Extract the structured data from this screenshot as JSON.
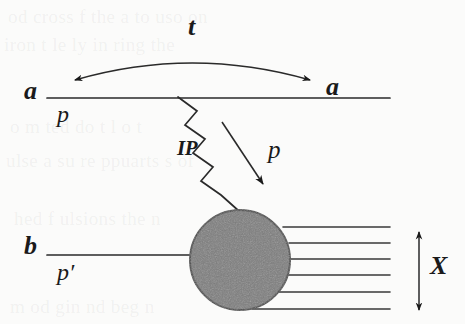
{
  "figure": {
    "kind": "feynman-diagram",
    "width": 465,
    "height": 324,
    "background_color": "#fbfbfa",
    "ink_color": "#1a1a1a",
    "blob_fill_color": "#7d7d7d",
    "blob_stroke_color": "#4a4a4a"
  },
  "labels": {
    "a_left": "a",
    "a_right": "a",
    "p_top": "p",
    "t": "t",
    "pomeron": "IP",
    "p_out": "p",
    "b_left": "b",
    "p_prime": "p′",
    "X": "X"
  },
  "elements": {
    "top_line": {
      "name": "beam-line-a",
      "x1": 47,
      "y1": 98,
      "x2": 390,
      "y2": 98
    },
    "bottom_line": {
      "name": "beam-line-b",
      "x1": 47,
      "y1": 255,
      "x2": 200,
      "y2": 255
    },
    "momentum_transfer_arc": {
      "name": "t-arc",
      "start_x": 75,
      "start_y": 80,
      "ctrl_x": 192,
      "ctrl_y": 48,
      "end_x": 310,
      "end_y": 80,
      "double_headed": true
    },
    "pomeron_zigzag": {
      "name": "pomeron-exchange",
      "points": "178,97 196,110 186,124 204,138 193,152 211,166 200,180 218,194 239,211"
    },
    "outgoing_proton_arrow": {
      "name": "outgoing-proton-arrow",
      "x1": 222,
      "y1": 122,
      "x2": 264,
      "y2": 186
    },
    "blob": {
      "name": "dissociation-blob",
      "cx": 240,
      "cy": 260,
      "r": 50
    },
    "x_system_lines": {
      "name": "x-system-lines",
      "count": 6,
      "lines": [
        {
          "x1": 283,
          "y1": 227,
          "x2": 390,
          "y2": 227
        },
        {
          "x1": 289,
          "y1": 243,
          "x2": 390,
          "y2": 243
        },
        {
          "x1": 290,
          "y1": 259,
          "x2": 390,
          "y2": 259
        },
        {
          "x1": 288,
          "y1": 275,
          "x2": 390,
          "y2": 275
        },
        {
          "x1": 279,
          "y1": 292,
          "x2": 390,
          "y2": 292
        },
        {
          "x1": 252,
          "y1": 309,
          "x2": 390,
          "y2": 309
        }
      ]
    },
    "x_extent_arrow": {
      "name": "x-extent-arrow",
      "x": 419,
      "y_top": 230,
      "y_bottom": 312,
      "double_headed": true
    }
  },
  "ghost_text": [
    {
      "text": "od  cross  f  the  a  to uso  on",
      "left": 8,
      "top": 6
    },
    {
      "text": "iron  t  le ly   in       ring   the",
      "left": 4,
      "top": 34
    },
    {
      "text": "o    m     ted   do   t  l  o   t",
      "left": 10,
      "top": 116
    },
    {
      "text": "ulse    a  su   re   ppuarts   s  of",
      "left": 6,
      "top": 150
    },
    {
      "text": "hed   f   ulsions   the   n",
      "left": 14,
      "top": 208
    },
    {
      "text": "m   od   gin    nd  beg  n",
      "left": 10,
      "top": 296
    }
  ]
}
